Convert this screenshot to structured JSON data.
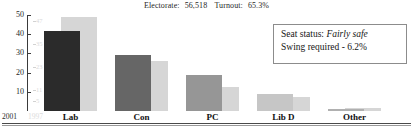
{
  "header": {
    "electorate_label": "Electorate:",
    "electorate_value": "56,518",
    "turnout_label": "Turnout:",
    "turnout_value": "65.3%"
  },
  "infobox": {
    "seat_status_label": "Seat status:",
    "seat_status_value": "Fairly safe",
    "swing_text": "Swing required - 6.2%"
  },
  "legend": {
    "year_current": "2001",
    "year_previous": "1997"
  },
  "chart_data": {
    "type": "bar",
    "title": "",
    "xlabel": "",
    "ylabel": "",
    "ylim": [
      0,
      50
    ],
    "yticks": [
      50,
      40,
      30,
      20,
      10
    ],
    "ytick_labels": [
      "50",
      "40",
      "30",
      "20",
      "10"
    ],
    "secondary_ticks": [
      47,
      35,
      23,
      11,
      5
    ],
    "secondary_tick_labels": [
      "47",
      "35",
      "23",
      "11",
      "5"
    ],
    "grid": false,
    "legend_position": "axis-left",
    "categories": [
      "Lab",
      "Con",
      "PC",
      "Lib D",
      "Other"
    ],
    "series": [
      {
        "name": "2001",
        "color": "#2b2b2b",
        "values": [
          41.5,
          29.2,
          18.5,
          9.0,
          1.0
        ]
      },
      {
        "name": "1997",
        "color": "#d6d6d6",
        "values": [
          49.0,
          26.0,
          12.5,
          7.5,
          1.8
        ]
      }
    ],
    "bar_colors_2001": [
      "#2b2b2b",
      "#666666",
      "#969696",
      "#c6c6c6",
      "#b0b0b0"
    ]
  }
}
